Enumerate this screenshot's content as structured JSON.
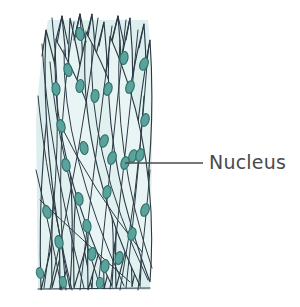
{
  "figure": {
    "kind": "biological-illustration",
    "background_color": "#ffffff",
    "width": 300,
    "height": 307
  },
  "annotation": {
    "label": "Nucleus",
    "text_color": "#4a4a4a",
    "leader_line": {
      "color": "#4a4a4a",
      "x1": 125,
      "y1": 163,
      "x2": 203,
      "y2": 163,
      "width": 1.3
    }
  },
  "palette": {
    "cell_fill": "#dcefee",
    "cell_fill_light": "#e8f5f4",
    "cell_outline": "#2b3a45",
    "nucleus_fill": "#5aa39c",
    "nucleus_stroke": "#2f6f69",
    "paper": "#ffffff"
  },
  "tissue": {
    "bounds": {
      "x": 35,
      "y": 13,
      "width": 117,
      "height": 277
    },
    "cell_count": 26,
    "nucleus_count": 31,
    "description": "Elongated spindle-shaped smooth muscle cells interwoven in overlapping sheets, each containing one central oval nucleus.",
    "cells": [
      {
        "id": 1,
        "top_x": 62,
        "top_y": 16,
        "bottom_x": 41,
        "bottom_y": 290,
        "bulge": 11
      },
      {
        "id": 2,
        "top_x": 80,
        "top_y": 14,
        "bottom_x": 52,
        "bottom_y": 288,
        "bulge": 9
      },
      {
        "id": 3,
        "top_x": 70,
        "top_y": 18,
        "bottom_x": 92,
        "bottom_y": 289,
        "bulge": 10
      },
      {
        "id": 4,
        "top_x": 92,
        "top_y": 14,
        "bottom_x": 60,
        "bottom_y": 290,
        "bulge": 12
      },
      {
        "id": 5,
        "top_x": 104,
        "top_y": 22,
        "bottom_x": 74,
        "bottom_y": 288,
        "bulge": 10
      },
      {
        "id": 6,
        "top_x": 118,
        "top_y": 16,
        "bottom_x": 88,
        "bottom_y": 290,
        "bulge": 11
      },
      {
        "id": 7,
        "top_x": 130,
        "top_y": 18,
        "bottom_x": 104,
        "bottom_y": 289,
        "bulge": 9
      },
      {
        "id": 8,
        "top_x": 144,
        "top_y": 24,
        "bottom_x": 116,
        "bottom_y": 288,
        "bulge": 10
      },
      {
        "id": 9,
        "top_x": 150,
        "top_y": 40,
        "bottom_x": 132,
        "bottom_y": 287,
        "bulge": 8
      },
      {
        "id": 10,
        "top_x": 46,
        "top_y": 30,
        "bottom_x": 70,
        "bottom_y": 289,
        "bulge": 9
      },
      {
        "id": 11,
        "top_x": 56,
        "top_y": 40,
        "bottom_x": 112,
        "bottom_y": 286,
        "bulge": 12
      },
      {
        "id": 12,
        "top_x": 86,
        "top_y": 32,
        "bottom_x": 140,
        "bottom_y": 286,
        "bulge": 11
      },
      {
        "id": 13,
        "top_x": 110,
        "top_y": 36,
        "bottom_x": 150,
        "bottom_y": 282,
        "bulge": 9
      }
    ],
    "nuclei": [
      {
        "cx": 80,
        "cy": 34,
        "rx": 4.0,
        "ry": 6.5,
        "angle": -8
      },
      {
        "cx": 124,
        "cy": 58,
        "rx": 4.0,
        "ry": 6.5,
        "angle": 10
      },
      {
        "cx": 68,
        "cy": 70,
        "rx": 4.0,
        "ry": 6.5,
        "angle": -12
      },
      {
        "cx": 56,
        "cy": 89,
        "rx": 4.0,
        "ry": 6.5,
        "angle": -6
      },
      {
        "cx": 80,
        "cy": 86,
        "rx": 4.0,
        "ry": 6.5,
        "angle": 8
      },
      {
        "cx": 95,
        "cy": 96,
        "rx": 4.0,
        "ry": 6.5,
        "angle": 6
      },
      {
        "cx": 108,
        "cy": 89,
        "rx": 4.0,
        "ry": 6.5,
        "angle": 14
      },
      {
        "cx": 130,
        "cy": 87,
        "rx": 4.0,
        "ry": 6.5,
        "angle": 18
      },
      {
        "cx": 144,
        "cy": 64,
        "rx": 4.0,
        "ry": 6.5,
        "angle": 22
      },
      {
        "cx": 145,
        "cy": 120,
        "rx": 4.0,
        "ry": 6.5,
        "angle": 16
      },
      {
        "cx": 61,
        "cy": 126,
        "rx": 4.0,
        "ry": 6.5,
        "angle": -14
      },
      {
        "cx": 104,
        "cy": 141,
        "rx": 4.0,
        "ry": 6.5,
        "angle": 20
      },
      {
        "cx": 84,
        "cy": 148,
        "rx": 4.0,
        "ry": 6.5,
        "angle": -10
      },
      {
        "cx": 112,
        "cy": 158,
        "rx": 4.0,
        "ry": 6.5,
        "angle": 18
      },
      {
        "cx": 133,
        "cy": 156,
        "rx": 4.0,
        "ry": 6.5,
        "angle": 20
      },
      {
        "cx": 125,
        "cy": 163,
        "rx": 4.0,
        "ry": 6.5,
        "angle": 14
      },
      {
        "cx": 66,
        "cy": 165,
        "rx": 4.0,
        "ry": 6.5,
        "angle": -12
      },
      {
        "cx": 140,
        "cy": 155,
        "rx": 4.0,
        "ry": 6.5,
        "angle": 16
      },
      {
        "cx": 79,
        "cy": 199,
        "rx": 4.0,
        "ry": 6.5,
        "angle": -10
      },
      {
        "cx": 107,
        "cy": 192,
        "rx": 4.0,
        "ry": 6.5,
        "angle": 12
      },
      {
        "cx": 47,
        "cy": 212,
        "rx": 4.0,
        "ry": 6.5,
        "angle": -16
      },
      {
        "cx": 87,
        "cy": 226,
        "rx": 4.0,
        "ry": 6.5,
        "angle": -8
      },
      {
        "cx": 132,
        "cy": 234,
        "rx": 4.0,
        "ry": 6.5,
        "angle": 14
      },
      {
        "cx": 145,
        "cy": 210,
        "rx": 4.0,
        "ry": 6.5,
        "angle": 18
      },
      {
        "cx": 59,
        "cy": 242,
        "rx": 4.0,
        "ry": 6.5,
        "angle": -12
      },
      {
        "cx": 92,
        "cy": 254,
        "rx": 4.0,
        "ry": 6.5,
        "angle": 10
      },
      {
        "cx": 105,
        "cy": 266,
        "rx": 4.0,
        "ry": 6.5,
        "angle": 8
      },
      {
        "cx": 119,
        "cy": 258,
        "rx": 4.0,
        "ry": 6.5,
        "angle": 12
      },
      {
        "cx": 63,
        "cy": 282,
        "rx": 3.6,
        "ry": 5.5,
        "angle": -10
      },
      {
        "cx": 100,
        "cy": 283,
        "rx": 3.6,
        "ry": 5.5,
        "angle": 6
      },
      {
        "cx": 40,
        "cy": 273,
        "rx": 3.6,
        "ry": 5.5,
        "angle": -14
      }
    ]
  }
}
